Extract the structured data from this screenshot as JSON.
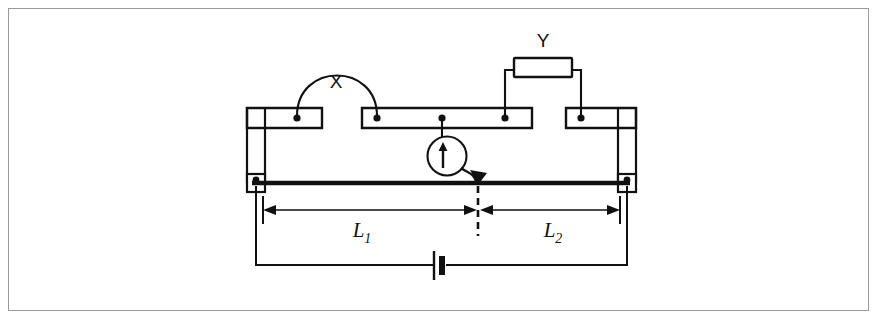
{
  "figure": {
    "type": "circuit-diagram",
    "name": "metre-bridge-circuit",
    "background_color": "#ffffff",
    "ink_color": "#111111",
    "frame_color": "#9a9a9a",
    "width": 879,
    "height": 321
  },
  "labels": {
    "unknown_resistor": "X",
    "known_resistor": "Y",
    "length_left": "L",
    "length_left_sub": "1",
    "length_right": "L",
    "length_right_sub": "2"
  },
  "components": [
    {
      "id": "resistor-x",
      "label": "X",
      "shape": "arc-wire",
      "data_name": "resistor-x"
    },
    {
      "id": "resistor-y",
      "label": "Y",
      "shape": "rectangle-box",
      "data_name": "resistor-y"
    },
    {
      "id": "galvanometer",
      "label": "",
      "shape": "circle-with-arrow",
      "data_name": "galvanometer"
    },
    {
      "id": "jockey",
      "label": "",
      "shape": "arrow-contact",
      "data_name": "jockey-contact"
    },
    {
      "id": "battery",
      "label": "",
      "shape": "cell-symbol",
      "data_name": "battery-cell"
    },
    {
      "id": "resistance-wire",
      "label": "",
      "shape": "thick-line",
      "data_name": "resistance-wire"
    }
  ],
  "dimensions": {
    "left_segment_label": "L₁",
    "right_segment_label": "L₂",
    "left_start_x": 263,
    "balance_point_x": 478,
    "right_end_x": 620
  },
  "terminal_blocks": [
    {
      "id": "block-left",
      "dots": 1
    },
    {
      "id": "block-center",
      "dots": 3
    },
    {
      "id": "block-right",
      "dots": 1
    }
  ]
}
